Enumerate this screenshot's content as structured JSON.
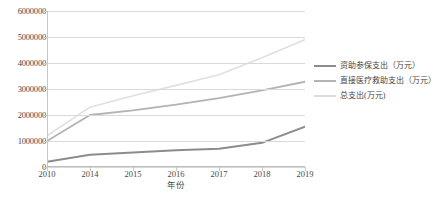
{
  "chart_data": {
    "type": "line",
    "title": "",
    "xlabel": "年份",
    "ylabel": "",
    "categories": [
      "2010",
      "2014",
      "2015",
      "2016",
      "2017",
      "2018",
      "2019"
    ],
    "ylim": [
      0,
      6000000
    ],
    "ytick_labels": [
      "0",
      "1000000",
      "2000000",
      "3000000",
      "4000000",
      "5000000",
      "6000000"
    ],
    "ytick_values": [
      0,
      1000000,
      2000000,
      3000000,
      4000000,
      5000000,
      6000000
    ],
    "grid": true,
    "legend_position": "right",
    "series": [
      {
        "name": "资助参保支出（万元）",
        "color": "#8c8c8c",
        "values": [
          200000,
          470000,
          560000,
          640000,
          700000,
          930000,
          1550000
        ]
      },
      {
        "name": "直接医疗救助支出（万元）",
        "color": "#b3b3b3",
        "values": [
          1000000,
          2000000,
          2180000,
          2400000,
          2650000,
          2950000,
          3280000
        ]
      },
      {
        "name": "总支出(万元)",
        "color": "#e0e0e0",
        "values": [
          1200000,
          2300000,
          2740000,
          3140000,
          3550000,
          4200000,
          4900000
        ]
      }
    ]
  },
  "axis": {
    "x_title": "年份"
  },
  "caption": {
    "text": ""
  }
}
